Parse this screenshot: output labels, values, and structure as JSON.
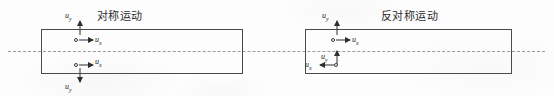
{
  "figure": {
    "background_color": "#fdfdfd",
    "line_color": "#4a4a4a",
    "dash_color": "#9a9a9a",
    "arrow_color": "#2e2e2e"
  },
  "centerline": {
    "name": "symmetry-axis",
    "style": "dashed"
  },
  "panels": [
    {
      "id": "symmetric",
      "title": "对称运动",
      "clusters": [
        {
          "id": "upper",
          "uy": {
            "label": "u",
            "sub": "y",
            "direction": "up"
          },
          "ux": {
            "label": "u",
            "sub": "x",
            "direction": "right"
          }
        },
        {
          "id": "lower",
          "uy": {
            "label": "u",
            "sub": "y",
            "direction": "down"
          },
          "ux": {
            "label": "u",
            "sub": "x",
            "direction": "right"
          }
        }
      ]
    },
    {
      "id": "antisymmetric",
      "title": "反对称运动",
      "clusters": [
        {
          "id": "upper",
          "uy": {
            "label": "u",
            "sub": "y",
            "direction": "up"
          },
          "ux": {
            "label": "u",
            "sub": "x",
            "direction": "right"
          }
        },
        {
          "id": "lower",
          "uy": {
            "label": "u",
            "sub": "y",
            "direction": "up"
          },
          "ux": {
            "label": "u",
            "sub": "x",
            "direction": "left"
          }
        }
      ]
    }
  ]
}
